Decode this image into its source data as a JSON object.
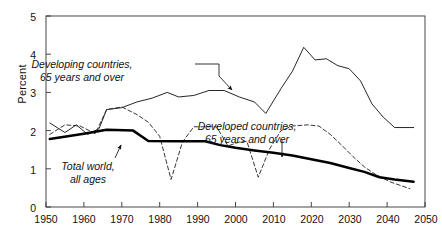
{
  "chart_data": {
    "type": "line",
    "title": "",
    "subtitle": "",
    "xlabel": "",
    "ylabel": "Percent",
    "xlim": [
      1950,
      2050
    ],
    "ylim": [
      0,
      5
    ],
    "xticks": [
      1950,
      1960,
      1970,
      1980,
      1990,
      2000,
      2010,
      2020,
      2030,
      2040,
      2050
    ],
    "yticks": [
      0,
      1,
      2,
      3,
      4,
      5
    ],
    "grid": false,
    "legend_position": "inline-annotations",
    "series": [
      {
        "name": "Developing countries, 65 years and over",
        "style": "thin-solid",
        "color": "#1a1a1a",
        "points": [
          [
            1951,
            2.2
          ],
          [
            1955,
            1.95
          ],
          [
            1958,
            2.15
          ],
          [
            1961,
            1.9
          ],
          [
            1964,
            2.05
          ],
          [
            1966,
            2.55
          ],
          [
            1970,
            2.6
          ],
          [
            1974,
            2.75
          ],
          [
            1978,
            2.85
          ],
          [
            1982,
            3.0
          ],
          [
            1985,
            2.88
          ],
          [
            1989,
            2.92
          ],
          [
            1993,
            3.05
          ],
          [
            1997,
            3.05
          ],
          [
            2001,
            2.88
          ],
          [
            2005,
            2.75
          ],
          [
            2008,
            2.45
          ],
          [
            2012,
            3.1
          ],
          [
            2015,
            3.55
          ],
          [
            2018,
            4.18
          ],
          [
            2021,
            3.85
          ],
          [
            2024,
            3.88
          ],
          [
            2027,
            3.7
          ],
          [
            2030,
            3.62
          ],
          [
            2033,
            3.3
          ],
          [
            2036,
            2.7
          ],
          [
            2039,
            2.35
          ],
          [
            2042,
            2.08
          ],
          [
            2047,
            2.08
          ]
        ]
      },
      {
        "name": "Developed countries, 65 years and over",
        "style": "dashed",
        "color": "#2b2b2b",
        "points": [
          [
            1951,
            1.9
          ],
          [
            1955,
            2.15
          ],
          [
            1959,
            2.12
          ],
          [
            1963,
            1.92
          ],
          [
            1966,
            2.55
          ],
          [
            1970,
            2.62
          ],
          [
            1974,
            2.42
          ],
          [
            1977,
            2.22
          ],
          [
            1980,
            1.85
          ],
          [
            1983,
            0.72
          ],
          [
            1986,
            1.7
          ],
          [
            1989,
            2.1
          ],
          [
            1992,
            2.1
          ],
          [
            1995,
            2.1
          ],
          [
            1998,
            1.6
          ],
          [
            2001,
            1.7
          ],
          [
            2003,
            1.72
          ],
          [
            2006,
            0.78
          ],
          [
            2009,
            1.52
          ],
          [
            2012,
            2.0
          ],
          [
            2015,
            2.12
          ],
          [
            2019,
            2.15
          ],
          [
            2022,
            2.12
          ],
          [
            2025,
            1.9
          ],
          [
            2028,
            1.62
          ],
          [
            2031,
            1.32
          ],
          [
            2034,
            1.05
          ],
          [
            2037,
            0.85
          ],
          [
            2041,
            0.65
          ],
          [
            2046,
            0.48
          ]
        ]
      },
      {
        "name": "Total world, all ages",
        "style": "thick-solid",
        "color": "#000000",
        "points": [
          [
            1951,
            1.78
          ],
          [
            1960,
            1.92
          ],
          [
            1966,
            2.02
          ],
          [
            1973,
            2.0
          ],
          [
            1977,
            1.73
          ],
          [
            1985,
            1.72
          ],
          [
            1992,
            1.72
          ],
          [
            1996,
            1.62
          ],
          [
            2000,
            1.55
          ],
          [
            2005,
            1.48
          ],
          [
            2010,
            1.42
          ],
          [
            2015,
            1.35
          ],
          [
            2020,
            1.25
          ],
          [
            2025,
            1.15
          ],
          [
            2030,
            1.02
          ],
          [
            2034,
            0.92
          ],
          [
            2038,
            0.78
          ],
          [
            2042,
            0.72
          ],
          [
            2047,
            0.66
          ]
        ]
      }
    ],
    "annotations": [
      {
        "id": "developing-annotation",
        "line1": "Developing countries,",
        "line2": "65 years and over",
        "text_x": 82,
        "text_y": 58,
        "leader": [
          [
            195,
            64
          ],
          [
            219,
            64
          ],
          [
            219,
            76
          ],
          [
            232,
            90
          ]
        ],
        "arrow_at": [
          232,
          90
        ]
      },
      {
        "id": "developed-annotation",
        "line1": "Developed countries,",
        "line2": "65 years and over",
        "text_x": 247,
        "text_y": 120,
        "leader": [
          [
            282,
            140
          ],
          [
            282,
            157
          ]
        ],
        "arrow_at": [
          282,
          157
        ]
      },
      {
        "id": "total-world-annotation",
        "line1": "Total world,",
        "line2": "all ages",
        "text_x": 88,
        "text_y": 160,
        "leader": [
          [
            115,
            158
          ],
          [
            121,
            145
          ]
        ],
        "arrow_at": [
          121,
          145
        ]
      }
    ]
  },
  "axes": {
    "y_title": "Percent",
    "y_tick_labels": [
      "5",
      "4",
      "3",
      "2",
      "1",
      "0"
    ],
    "x_tick_labels": [
      "1950",
      "1960",
      "1970",
      "1980",
      "1990",
      "2000",
      "2010",
      "2020",
      "2030",
      "2040",
      "2050"
    ]
  }
}
